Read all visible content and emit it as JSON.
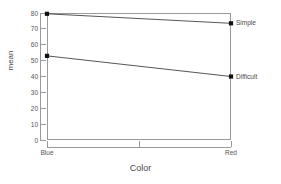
{
  "chart_data": {
    "type": "line",
    "title": "",
    "subtitle": "",
    "xlabel": "Color",
    "ylabel": "mean",
    "categories": [
      "Blue",
      "Red"
    ],
    "x": [
      0,
      1
    ],
    "series": [
      {
        "name": "Simple",
        "values": [
          79.5,
          73.5
        ]
      },
      {
        "name": "Difficult",
        "values": [
          53.0,
          40.0
        ]
      }
    ],
    "ylim": [
      0,
      80
    ],
    "xlim": [
      0,
      1
    ],
    "yticks": [
      0,
      10,
      20,
      30,
      40,
      50,
      60,
      70,
      80
    ],
    "ytick_labels": [
      "0",
      "10",
      "20",
      "30",
      "40",
      "50",
      "60",
      "70",
      "80"
    ],
    "xticks": [
      0,
      0.5,
      1
    ],
    "xtick_labels": [
      "Blue",
      "",
      "Red"
    ],
    "grid": false,
    "legend": "right-inline-series-labels",
    "marker": "filled-square",
    "marker_color": "#111111",
    "line_color": "#2b2b2b",
    "frame_color": "#9a9a9a",
    "background": "#ffffff"
  },
  "axes": {
    "y_title": "mean",
    "x_title": "Color"
  },
  "annotations": {
    "series_labels": [
      "Simple",
      "Difficult"
    ]
  }
}
